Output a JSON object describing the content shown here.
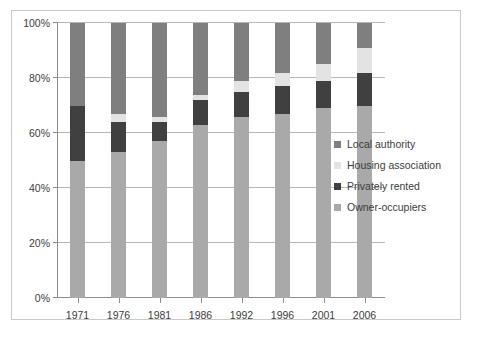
{
  "chart_data": {
    "type": "bar",
    "stacked": true,
    "stack_mode": "percent",
    "title": "",
    "subtitle": "",
    "xlabel": "",
    "ylabel": "",
    "categories": [
      "1971",
      "1976",
      "1981",
      "1986",
      "1992",
      "1996",
      "2001",
      "2006"
    ],
    "ylim": [
      0,
      100
    ],
    "ytick_labels": [
      "0%",
      "20%",
      "40%",
      "60%",
      "80%",
      "100%"
    ],
    "ytick_values": [
      0,
      20,
      40,
      60,
      80,
      100
    ],
    "grid": true,
    "legend_position": "right",
    "series": [
      {
        "name": "Local authority",
        "color": "#7f7f7f",
        "values": [
          30,
          33,
          34,
          26,
          21,
          18,
          15,
          9
        ]
      },
      {
        "name": "Housing association",
        "color": "#e3e3e3",
        "values": [
          0,
          3,
          2,
          2,
          4,
          5,
          6,
          9
        ]
      },
      {
        "name": "Privately rented",
        "color": "#404040",
        "values": [
          20,
          11,
          7,
          9,
          9,
          10,
          10,
          12
        ]
      },
      {
        "name": "Owner-occupiers",
        "color": "#a9a9a9",
        "values": [
          50,
          53,
          57,
          63,
          66,
          67,
          69,
          70
        ]
      }
    ]
  },
  "legend": {
    "items": [
      {
        "label": "Local authority"
      },
      {
        "label": "Housing association"
      },
      {
        "label": "Privately rented"
      },
      {
        "label": "Owner-occupiers"
      }
    ]
  },
  "colors": {
    "local_authority": "#7f7f7f",
    "housing_association": "#e3e3e3",
    "privately_rented": "#404040",
    "owner_occupiers": "#a9a9a9",
    "gridline": "#b7b7b7",
    "axis": "#8d8d8d",
    "text": "#3d3d3d",
    "frame": "#c9c9c9"
  }
}
